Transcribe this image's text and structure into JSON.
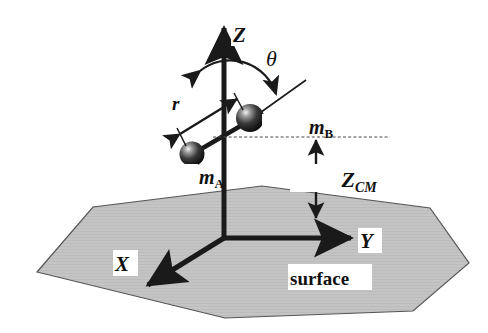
{
  "figure": {
    "background_color": "#ffffff",
    "ink_color": "#1a1a1a",
    "surface_fill": "#c4c4c4",
    "surface_stroke": "#555555",
    "sphere_color": "#1e1e1e",
    "sphere_highlight": "#f0f0f0"
  },
  "axes": {
    "z_label": "Z",
    "y_label": "Y",
    "x_label": "X"
  },
  "angles": {
    "theta_label": "θ"
  },
  "distances": {
    "bond_label": "r",
    "cm_height_symbol": "Z",
    "cm_height_subscript": "CM"
  },
  "masses": {
    "mass_a_symbol": "m",
    "mass_a_subscript": "A",
    "mass_b_symbol": "m",
    "mass_b_subscript": "B"
  },
  "surface": {
    "label": "surface"
  }
}
